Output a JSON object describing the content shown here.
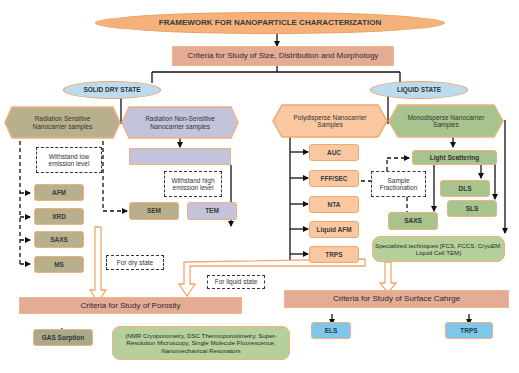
{
  "title": "FRAMEWORK FOR NANOPARTICLE CHARACTERIZATION",
  "criteria_size": "Criteria for Study of Size, Distribution and Morphology",
  "solid": {
    "label": "SOLID DRY STATE",
    "sensitive": "Radiation Sensitive Nanocarrier samples",
    "non_sensitive": "Radiation Non-Sensitive Nanocarrier samples",
    "non_sensitive_sub": "",
    "note_low": "Withstand low emission level",
    "note_high": "Withstand high emission level",
    "techniques": [
      "AFM",
      "XRD",
      "SAXS",
      "MS"
    ],
    "sem": "SEM",
    "tem": "TEM"
  },
  "liquid": {
    "label": "LIQUID STATE",
    "polydisperse": "Polydisperse Nanocarrier Samples",
    "monodisperse": "Monodisperse Nanocarrier Samples",
    "poly_techniques": [
      "AUC",
      "FFF/SEC",
      "NTA",
      "Liquid AFM",
      "TRPS"
    ],
    "sample_fractionation": "Sample Fractionation",
    "light_scattering": "Light Scattering",
    "dls": "DLS",
    "sls": "SLS",
    "saxs": "SAXS",
    "specialized": "Specialized techniques [FCS, FCCS, CryuEM, Liquid Cell TEM)"
  },
  "notes": {
    "dry": "For dry state",
    "liquid": "For liquid state"
  },
  "porosity": {
    "title": "Criteria for Study of Porosity",
    "gas": "GAS Sorption",
    "others": "(NMR Cryoporometry, DSC Thermoporosimetry, Super-Resolution Microscopy, Single Molecule Fluorescence, Nanomechanical Resonators"
  },
  "surface": {
    "title": "Criteria for Study of Surface Cahrge",
    "els": "ELS",
    "trps": "TRPS"
  },
  "colors": {
    "orange_ellipse": "#f4b27a",
    "blue_ellipse": "#bcdcee",
    "criteria": "#e4ab95",
    "olive": "#b8b08c",
    "lavender": "#c4c3dc",
    "light_orange": "#f9c8a0",
    "green": "#a8c48e",
    "blue_box": "#7ec6ea",
    "border_orange": "#f0b080"
  }
}
